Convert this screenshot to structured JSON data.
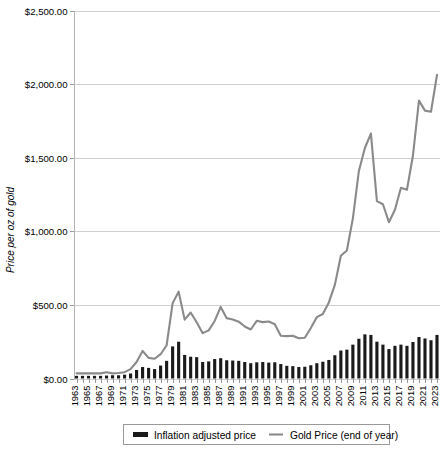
{
  "chart_data": {
    "type": "bar",
    "title": "",
    "xlabel": "",
    "ylabel": "Price per oz of gold",
    "ylim": [
      0,
      2500
    ],
    "ytick_labels": [
      "$0.00",
      "$500.00",
      "$1,000.00",
      "$1,500.00",
      "$2,000.00",
      "$2,500.00"
    ],
    "ytick_values": [
      0,
      500,
      1000,
      1500,
      2000,
      2500
    ],
    "grid": true,
    "legend_position": "bottom",
    "categories": [
      "1963",
      "1964",
      "1965",
      "1966",
      "1967",
      "1968",
      "1969",
      "1970",
      "1971",
      "1972",
      "1973",
      "1974",
      "1975",
      "1976",
      "1977",
      "1978",
      "1979",
      "1980",
      "1981",
      "1982",
      "1983",
      "1984",
      "1985",
      "1986",
      "1987",
      "1988",
      "1989",
      "1990",
      "1991",
      "1992",
      "1993",
      "1994",
      "1995",
      "1996",
      "1997",
      "1998",
      "1999",
      "2000",
      "2001",
      "2002",
      "2003",
      "2004",
      "2005",
      "2006",
      "2007",
      "2008",
      "2009",
      "2010",
      "2011",
      "2012",
      "2013",
      "2014",
      "2015",
      "2016",
      "2017",
      "2018",
      "2019",
      "2020",
      "2021",
      "2022",
      "2023"
    ],
    "xtick_labels": [
      "1963",
      "1965",
      "1967",
      "1969",
      "1971",
      "1973",
      "1975",
      "1977",
      "1979",
      "1981",
      "1983",
      "1985",
      "1987",
      "1989",
      "1991",
      "1993",
      "1995",
      "1997",
      "1999",
      "2001",
      "2003",
      "2005",
      "2007",
      "2009",
      "2011",
      "2013",
      "2015",
      "2017",
      "2019",
      "2021",
      "2023"
    ],
    "series": [
      {
        "name": "Inflation adjusted price",
        "render": "bar",
        "color": "#1a1a1a",
        "values": [
          18,
          18,
          18,
          18,
          18,
          20,
          22,
          22,
          26,
          34,
          58,
          78,
          72,
          64,
          88,
          120,
          218,
          250,
          160,
          148,
          145,
          112,
          116,
          132,
          138,
          124,
          122,
          120,
          112,
          104,
          110,
          112,
          108,
          110,
          98,
          86,
          84,
          78,
          80,
          90,
          104,
          114,
          126,
          158,
          190,
          196,
          230,
          270,
          300,
          296,
          250,
          230,
          200,
          222,
          230,
          222,
          248,
          282,
          272,
          260,
          296
        ]
      },
      {
        "name": "Gold Price (end of year)",
        "render": "line",
        "color": "#8a8a8a",
        "values": [
          35,
          35,
          35,
          35,
          35,
          42,
          35,
          37,
          43,
          64,
          112,
          187,
          140,
          134,
          165,
          226,
          512,
          590,
          400,
          448,
          382,
          308,
          327,
          391,
          486,
          410,
          401,
          386,
          353,
          333,
          392,
          383,
          387,
          369,
          290,
          288,
          290,
          273,
          277,
          343,
          417,
          438,
          517,
          636,
          834,
          870,
          1088,
          1410,
          1566,
          1664,
          1205,
          1184,
          1062,
          1146,
          1296,
          1282,
          1515,
          1888,
          1820,
          1812,
          2063
        ]
      }
    ]
  },
  "legend": {
    "items": [
      {
        "label": "Inflation adjusted price",
        "marker": "bar-swatch-icon"
      },
      {
        "label": "Gold Price (end of year)",
        "marker": "line-swatch-icon"
      }
    ]
  }
}
